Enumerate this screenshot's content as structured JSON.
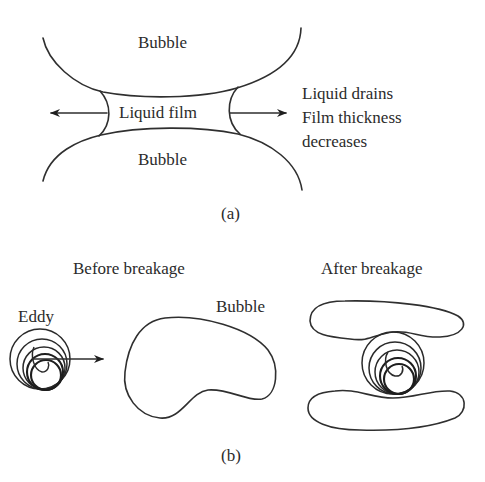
{
  "figure": {
    "panel_a": {
      "caption": "(a)",
      "upper_bubble_label": "Bubble",
      "lower_bubble_label": "Bubble",
      "film_label": "Liquid film",
      "annotation_lines": [
        "Liquid drains",
        "Film thickness",
        "decreases"
      ],
      "arrows": [
        "left-arrow",
        "right-arrow"
      ]
    },
    "panel_b": {
      "caption": "(b)",
      "before_title": "Before breakage",
      "after_title": "After breakage",
      "eddy_label": "Eddy",
      "bubble_label": "Bubble",
      "arrows": [
        "eddy-motion-arrow"
      ]
    },
    "colors": {
      "line": "#2f2f2f",
      "text": "#2b2b2b",
      "background": "#ffffff"
    }
  }
}
